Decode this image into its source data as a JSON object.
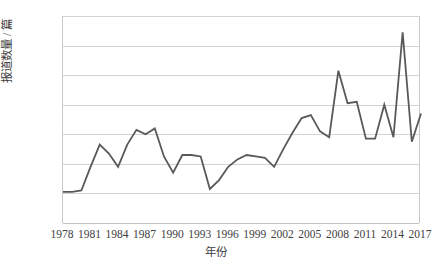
{
  "chart_data": {
    "type": "line",
    "title": "",
    "xlabel": "年份",
    "ylabel": "报道数量 / 篇",
    "xlim": [
      1978,
      2017
    ],
    "ylim": [
      0,
      140
    ],
    "ytick_step": 20,
    "xtick_step": 3,
    "grid": true,
    "legend": "none",
    "line_color": "#595959",
    "line_width": 1.8,
    "yticks": [
      0,
      20,
      40,
      60,
      80,
      100,
      120,
      140
    ],
    "xticks": [
      1978,
      1981,
      1984,
      1987,
      1990,
      1993,
      1996,
      1999,
      2002,
      2005,
      2008,
      2011,
      2014,
      2017
    ],
    "x": [
      1978,
      1979,
      1980,
      1981,
      1982,
      1983,
      1984,
      1985,
      1986,
      1987,
      1988,
      1989,
      1990,
      1991,
      1992,
      1993,
      1994,
      1995,
      1996,
      1997,
      1998,
      1999,
      2000,
      2001,
      2002,
      2003,
      2004,
      2005,
      2006,
      2007,
      2008,
      2009,
      2010,
      2011,
      2012,
      2013,
      2014,
      2015,
      2016,
      2017
    ],
    "values": [
      21,
      21,
      22,
      38,
      53,
      47,
      38,
      53,
      63,
      60,
      64,
      45,
      34,
      46,
      46,
      45,
      23,
      29,
      38,
      43,
      46,
      45,
      44,
      38,
      50,
      61,
      71,
      73,
      62,
      58,
      103,
      81,
      82,
      57,
      57,
      80,
      58,
      129,
      55,
      74
    ],
    "annotations": []
  },
  "axis": {
    "y_title": "报道数量 / 篇",
    "x_title": "年份"
  }
}
